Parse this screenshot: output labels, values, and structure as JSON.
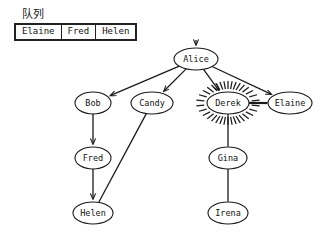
{
  "queue": {
    "title": "队列",
    "items": [
      "Elaine",
      "Fred",
      "Helen"
    ]
  },
  "graph": {
    "nodes": [
      {
        "id": "alice",
        "label": "Alice",
        "x": 196,
        "y": 59,
        "rx": 22,
        "ry": 11,
        "highlighted": false
      },
      {
        "id": "bob",
        "label": "Bob",
        "x": 93,
        "y": 103,
        "rx": 18,
        "ry": 11,
        "highlighted": false
      },
      {
        "id": "candy",
        "label": "Candy",
        "x": 152,
        "y": 103,
        "rx": 21,
        "ry": 11,
        "highlighted": false
      },
      {
        "id": "derek",
        "label": "Derek",
        "x": 228,
        "y": 103,
        "rx": 21,
        "ry": 11,
        "highlighted": true
      },
      {
        "id": "elaine",
        "label": "Elaine",
        "x": 290,
        "y": 103,
        "rx": 22,
        "ry": 11,
        "highlighted": false
      },
      {
        "id": "fred",
        "label": "Fred",
        "x": 93,
        "y": 158,
        "rx": 18,
        "ry": 11,
        "highlighted": false
      },
      {
        "id": "gina",
        "label": "Gina",
        "x": 228,
        "y": 158,
        "rx": 19,
        "ry": 11,
        "highlighted": false
      },
      {
        "id": "helen",
        "label": "Helen",
        "x": 93,
        "y": 213,
        "rx": 20,
        "ry": 11,
        "highlighted": false
      },
      {
        "id": "irena",
        "label": "Irena",
        "x": 228,
        "y": 213,
        "rx": 20,
        "ry": 11,
        "highlighted": false
      }
    ],
    "edges": [
      {
        "from": "alice",
        "to": "bob",
        "arrow": true,
        "style": "thin"
      },
      {
        "from": "alice",
        "to": "candy",
        "arrow": true,
        "style": "thin"
      },
      {
        "from": "alice",
        "to": "derek",
        "arrow": true,
        "style": "thin"
      },
      {
        "from": "alice",
        "to": "elaine",
        "arrow": true,
        "style": "thin"
      },
      {
        "from": "bob",
        "to": "fred",
        "arrow": true,
        "style": "thin"
      },
      {
        "from": "fred",
        "to": "helen",
        "arrow": true,
        "style": "thin"
      },
      {
        "from": "candy",
        "to": "helen",
        "arrow": false,
        "style": "thin"
      },
      {
        "from": "derek",
        "to": "gina",
        "arrow": false,
        "style": "thin"
      },
      {
        "from": "gina",
        "to": "irena",
        "arrow": false,
        "style": "thin"
      },
      {
        "from": "derek",
        "to": "elaine",
        "arrow": false,
        "style": "thick"
      }
    ],
    "root_inbound_arrow": {
      "x": 196,
      "y": 40,
      "label": "entry-arrow"
    },
    "highlight": {
      "node": "derek",
      "ray_count": 34,
      "ray_inner_gap": 3,
      "ray_length": 8
    },
    "colors": {
      "stroke": "#1a1a1a",
      "node_fill": "#ffffff",
      "text": "#111111",
      "background": "#ffffff"
    }
  }
}
